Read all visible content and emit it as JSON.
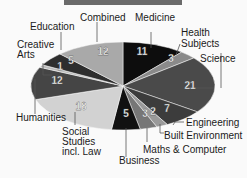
{
  "chart_data": {
    "type": "pie",
    "title": "",
    "categories": [
      "Medicine",
      "Health Subjects",
      "Science",
      "Engineering",
      "Built Environment",
      "Maths & Computer",
      "Business",
      "Social Studies incl. Law",
      "Humanities",
      "Creative Arts",
      "Education",
      "Combined"
    ],
    "values": [
      11,
      3,
      21,
      7,
      2,
      3,
      5,
      18,
      12,
      1,
      5,
      12
    ],
    "colors": [
      "#0d0d0d",
      "#8a8a8a",
      "#4a4a4a",
      "#3c3c3c",
      "#9a9a9a",
      "#777777",
      "#111111",
      "#d2d2d2",
      "#454545",
      "#bcbcbc",
      "#2e2e2e",
      "#a9a9a9"
    ],
    "start_angle": "12 o'clock",
    "direction": "clockwise",
    "legend": "none (callout labels)"
  },
  "labels": {
    "medicine": "Medicine",
    "health1": "Health",
    "health2": "Subjects",
    "science": "Science",
    "engineering": "Engineering",
    "built": "Built Environment",
    "maths": "Maths & Computer",
    "business": "Business",
    "social1": "Social",
    "social2": "Studies",
    "social3": "incl. Law",
    "humanities": "Humanities",
    "creative1": "Creative",
    "creative2": "Arts",
    "education": "Education",
    "combined": "Combined"
  },
  "values_text": {
    "medicine": "11",
    "health": "3",
    "science": "21",
    "engineering": "7",
    "built": "2",
    "maths": "3",
    "business": "5",
    "social": "18",
    "humanities": "12",
    "creative": "1",
    "education": "5",
    "combined": "12"
  }
}
